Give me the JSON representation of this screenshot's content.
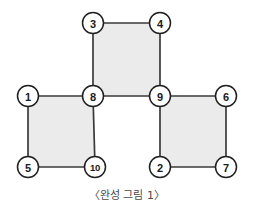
{
  "figure": {
    "caption": "〈완성 그림 1〉",
    "caption_font_size_px": 11,
    "caption_top_px": 186,
    "background_color": "#ffffff",
    "canvas": {
      "width": 254,
      "height": 218
    }
  },
  "style": {
    "square_fill": "#ebebeb",
    "square_border_color": "#3a3a3a",
    "edge_color": "#3a3a3a",
    "edge_width": 1.7,
    "node_stroke_color": "#1f1f1f",
    "node_stroke_width": 1.5,
    "node_fill": "#ffffff",
    "node_radius": 10.5,
    "node_label_color": "#1a1a1a",
    "node_label_font_size": 11
  },
  "chart_data": {
    "type": "diagram",
    "title": "〈완성 그림 1〉",
    "nodes": [
      {
        "id": "1",
        "label": "1",
        "x": 28,
        "y": 96
      },
      {
        "id": "2",
        "label": "2",
        "x": 160,
        "y": 167
      },
      {
        "id": "3",
        "label": "3",
        "x": 93,
        "y": 23
      },
      {
        "id": "4",
        "label": "4",
        "x": 160,
        "y": 23
      },
      {
        "id": "5",
        "label": "5",
        "x": 28,
        "y": 167
      },
      {
        "id": "6",
        "label": "6",
        "x": 226,
        "y": 96
      },
      {
        "id": "7",
        "label": "7",
        "x": 226,
        "y": 167
      },
      {
        "id": "8",
        "label": "8",
        "x": 93,
        "y": 96
      },
      {
        "id": "9",
        "label": "9",
        "x": 160,
        "y": 96
      },
      {
        "id": "10",
        "label": "10",
        "x": 95,
        "y": 167
      }
    ],
    "edges": [
      {
        "from": "3",
        "to": "4"
      },
      {
        "from": "3",
        "to": "8"
      },
      {
        "from": "4",
        "to": "9"
      },
      {
        "from": "8",
        "to": "9"
      },
      {
        "from": "1",
        "to": "8"
      },
      {
        "from": "1",
        "to": "5"
      },
      {
        "from": "5",
        "to": "10"
      },
      {
        "from": "8",
        "to": "10"
      },
      {
        "from": "9",
        "to": "6"
      },
      {
        "from": "6",
        "to": "7"
      },
      {
        "from": "2",
        "to": "7"
      },
      {
        "from": "9",
        "to": "2"
      }
    ],
    "squares": [
      {
        "name": "top-center-square",
        "corners": [
          "3",
          "4",
          "9",
          "8"
        ]
      },
      {
        "name": "bottom-left-square",
        "corners": [
          "1",
          "8",
          "10",
          "5"
        ]
      },
      {
        "name": "bottom-right-square",
        "corners": [
          "9",
          "6",
          "7",
          "2"
        ]
      }
    ]
  }
}
